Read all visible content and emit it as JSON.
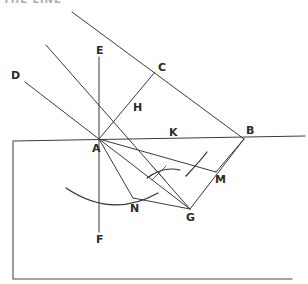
{
  "figure": {
    "kind": "hand-drawn geometric construction",
    "title_fragment": "THE LINE",
    "background_color": "#ffffff",
    "ink_color": "#3b3b3b",
    "width": 308,
    "height": 284
  },
  "points": [
    {
      "id": "A",
      "label": "A",
      "x": 99,
      "y": 139,
      "label_x": 92,
      "label_y": 152
    },
    {
      "id": "B",
      "label": "B",
      "x": 244,
      "y": 139,
      "label_x": 246,
      "label_y": 134
    },
    {
      "id": "C",
      "label": "C",
      "x": 155,
      "y": 72,
      "label_x": 158,
      "label_y": 71
    },
    {
      "id": "D",
      "label": "D",
      "x": 25,
      "y": 82,
      "label_x": 11,
      "label_y": 79
    },
    {
      "id": "E",
      "label": "E",
      "x": 99,
      "y": 57,
      "label_x": 96,
      "label_y": 54
    },
    {
      "id": "F",
      "label": "F",
      "x": 99,
      "y": 232,
      "label_x": 96,
      "label_y": 243
    },
    {
      "id": "G",
      "label": "G",
      "x": 190,
      "y": 209,
      "label_x": 186,
      "label_y": 221
    },
    {
      "id": "H",
      "label": "H",
      "x": 130,
      "y": 102,
      "label_x": 133,
      "label_y": 111
    },
    {
      "id": "K",
      "label": "K",
      "x": 171,
      "y": 130,
      "label_x": 169,
      "label_y": 136
    },
    {
      "id": "M",
      "label": "M",
      "x": 216,
      "y": 172,
      "label_x": 215,
      "label_y": 183
    },
    {
      "id": "N",
      "label": "N",
      "x": 133,
      "y": 198,
      "label_x": 130,
      "label_y": 212
    }
  ],
  "segments": [
    {
      "name": "ray-upper-left-to-B-through-C",
      "from": [
        72,
        12
      ],
      "to": [
        244,
        139
      ]
    },
    {
      "name": "ray-mid-left-through-H-to-G",
      "from": [
        46,
        45
      ],
      "to": [
        190,
        209
      ]
    },
    {
      "name": "ray-D-to-A",
      "from": [
        25,
        82
      ],
      "to": [
        99,
        139
      ]
    },
    {
      "name": "horizontal-baseline",
      "from": [
        13,
        141
      ],
      "to": [
        305,
        136
      ]
    },
    {
      "name": "vertical-EF",
      "from": [
        99,
        57
      ],
      "to": [
        99,
        232
      ]
    },
    {
      "name": "segment-C-to-H",
      "from": [
        155,
        72
      ],
      "to": [
        130,
        102
      ]
    },
    {
      "name": "segment-H-to-A",
      "from": [
        130,
        102
      ],
      "to": [
        99,
        139
      ]
    },
    {
      "name": "segment-A-to-M",
      "from": [
        99,
        139
      ],
      "to": [
        216,
        172
      ]
    },
    {
      "name": "segment-M-to-B",
      "from": [
        216,
        172
      ],
      "to": [
        244,
        139
      ]
    },
    {
      "name": "segment-A-to-N",
      "from": [
        99,
        139
      ],
      "to": [
        133,
        198
      ]
    },
    {
      "name": "segment-N-to-G-extension",
      "from": [
        133,
        198
      ],
      "to": [
        190,
        209
      ]
    },
    {
      "name": "segment-G-to-B",
      "from": [
        190,
        209
      ],
      "to": [
        244,
        139
      ]
    },
    {
      "name": "segment-A-to-G-chord",
      "from": [
        99,
        139
      ],
      "to": [
        190,
        209
      ]
    }
  ],
  "arcs": [
    {
      "name": "main-compass-arc",
      "path": "M 66 188 Q 112 219 158 193",
      "description": "large compass arc below A sweeping right"
    },
    {
      "name": "construction-arc-near-M",
      "path": "M 186 176 Q 201 160 207 152",
      "description": "short construction arc near M"
    },
    {
      "name": "construction-arc-crossing",
      "path": "M 147 178 Q 163 166 180 170",
      "description": "small intersecting construction arc"
    }
  ],
  "tick_marks": [
    {
      "name": "cross-tick-upper",
      "from": [
        152,
        166
      ],
      "to": [
        165,
        180
      ]
    },
    {
      "name": "cross-tick-lower",
      "from": [
        152,
        180
      ],
      "to": [
        166,
        166
      ]
    }
  ],
  "frame": {
    "name": "page-border-rectangle",
    "left": 13,
    "top": 142,
    "right": 292,
    "bottom": 279
  }
}
